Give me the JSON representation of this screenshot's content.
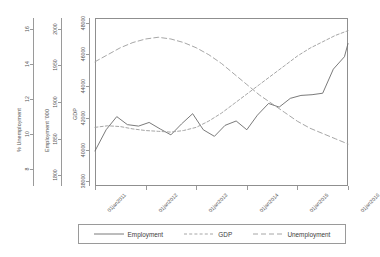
{
  "chart_data": {
    "type": "line",
    "title": "",
    "xlabel": "",
    "grid": false,
    "legend_position": "bottom",
    "x": [
      "01jan2011",
      "01jan2012",
      "01jan2013",
      "01jan2014",
      "01jan2015",
      "01jan2016"
    ],
    "x_tick_labels": [
      "01jan2011",
      "01jan2012",
      "01jan2013",
      "01jan2014",
      "01jan2015",
      "01jan2016"
    ],
    "axes": [
      {
        "id": "unemployment",
        "label": "% Unemployment",
        "ticks": [
          8,
          10,
          12,
          14,
          16
        ],
        "tick_labels": [
          "8",
          "10",
          "12",
          "14",
          "16"
        ],
        "range": [
          7.0,
          16.6
        ]
      },
      {
        "id": "employment",
        "label": "Employment '000",
        "ticks": [
          1800,
          1850,
          1900,
          1950,
          2000
        ],
        "tick_labels": [
          "1800",
          "1850",
          "1900",
          "1950",
          "2000"
        ],
        "range": [
          1785,
          2015
        ]
      },
      {
        "id": "gdp",
        "label": "GDP",
        "ticks": [
          38000,
          40000,
          42000,
          44000,
          46000,
          48000
        ],
        "tick_labels": [
          "38000",
          "40000",
          "42000",
          "44000",
          "46000",
          "48000"
        ],
        "range": [
          37700,
          48300
        ]
      }
    ],
    "series": [
      {
        "name": "Employment",
        "axis": "employment",
        "style": "solid",
        "color": "#6b6b6b",
        "x": [
          0.0,
          0.22,
          0.43,
          0.64,
          0.86,
          1.07,
          1.29,
          1.5,
          1.71,
          1.93,
          2.14,
          2.36,
          2.57,
          2.79,
          3.0,
          3.21,
          3.43,
          3.64,
          3.86,
          4.07,
          4.29,
          4.5,
          4.71,
          4.93,
          5.0
        ],
        "values": [
          1833,
          1862,
          1880,
          1869,
          1867,
          1872,
          1863,
          1855,
          1870,
          1884,
          1862,
          1853,
          1868,
          1874,
          1862,
          1882,
          1898,
          1893,
          1905,
          1909,
          1910,
          1912,
          1945,
          1962,
          1980
        ]
      },
      {
        "name": "GDP",
        "axis": "gdp",
        "style": "dashed-short",
        "color": "#9c9c9c",
        "x": [
          0.0,
          0.25,
          0.5,
          0.75,
          1.0,
          1.25,
          1.5,
          1.75,
          2.0,
          2.25,
          2.5,
          2.75,
          3.0,
          3.25,
          3.5,
          3.75,
          4.0,
          4.25,
          4.5,
          4.75,
          5.0
        ],
        "values": [
          41400,
          41500,
          41450,
          41300,
          41200,
          41150,
          41100,
          41200,
          41400,
          41800,
          42300,
          42900,
          43500,
          44100,
          44700,
          45300,
          45900,
          46400,
          46800,
          47200,
          47500
        ]
      },
      {
        "name": "Unemployment",
        "axis": "unemployment",
        "style": "dashed-long",
        "color": "#9c9c9c",
        "x": [
          0.0,
          0.25,
          0.5,
          0.75,
          1.0,
          1.25,
          1.5,
          1.75,
          2.0,
          2.25,
          2.5,
          2.75,
          3.0,
          3.25,
          3.5,
          3.75,
          4.0,
          4.25,
          4.5,
          4.75,
          5.0
        ],
        "values": [
          14.1,
          14.5,
          14.9,
          15.2,
          15.4,
          15.5,
          15.4,
          15.2,
          14.9,
          14.5,
          14.0,
          13.4,
          12.8,
          12.2,
          11.7,
          11.2,
          10.7,
          10.3,
          10.0,
          9.7,
          9.4
        ]
      }
    ]
  },
  "legend": {
    "items": [
      {
        "label": "Employment",
        "style": "solid"
      },
      {
        "label": "GDP",
        "style": "dashed-short"
      },
      {
        "label": "Unemployment",
        "style": "dashed-long"
      }
    ]
  },
  "colors": {
    "line_employment": "#6b6b6b",
    "line_gdp": "#9c9c9c",
    "line_unemployment": "#9c9c9c",
    "axis": "#8f8f8f",
    "text": "#555555",
    "background": "#ffffff"
  }
}
